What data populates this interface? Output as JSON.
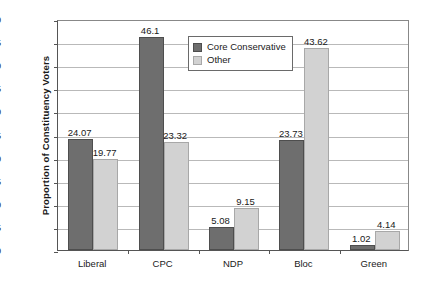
{
  "chart_data": {
    "type": "bar",
    "title": "",
    "xlabel": "",
    "ylabel": "Proportion of Constituency Voters",
    "categories": [
      "Liberal",
      "CPC",
      "NDP",
      "Bloc",
      "Green"
    ],
    "series": [
      {
        "name": "Core Conservative",
        "color": "#6e6e6e",
        "values": [
          24.07,
          46.1,
          5.08,
          23.73,
          1.02
        ],
        "labels": [
          "24.07",
          "46.1",
          "5.08",
          "23.73",
          "1.02"
        ]
      },
      {
        "name": "Other",
        "color": "#d2d2d2",
        "values": [
          19.77,
          23.32,
          9.15,
          43.62,
          4.14
        ],
        "labels": [
          "19.77",
          "23.32",
          "9.15",
          "43.62",
          "4.14"
        ]
      }
    ],
    "ylim": [
      0,
      50
    ],
    "ytick_step": 5,
    "yticks": [
      "50",
      "45",
      "40",
      "35",
      "30",
      "25",
      "20",
      "15",
      "10",
      "5",
      "0"
    ],
    "grid": true,
    "legend_position": "upper-center"
  },
  "legend": {
    "items": [
      {
        "label": "Core Conservative"
      },
      {
        "label": "Other"
      }
    ]
  }
}
